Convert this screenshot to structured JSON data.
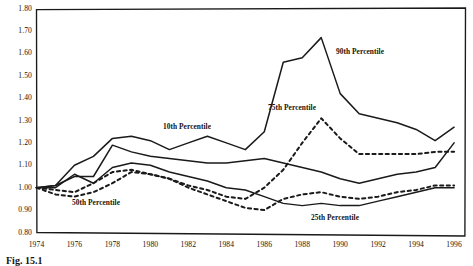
{
  "figure": {
    "caption": "Fig. 15.1",
    "background_color": "#ffffff",
    "line_color": "#1a1a1a"
  },
  "chart_data": {
    "type": "line",
    "title": "",
    "xlabel": "",
    "ylabel": "",
    "xlim": [
      1974,
      1996.6
    ],
    "ylim": [
      0.8,
      1.8
    ],
    "ytick_step": 0.1,
    "grid": false,
    "legend": "inline-annotations",
    "yticks": [
      "1.80",
      "1.70",
      "1.60",
      "1.50",
      "1.40",
      "1.30",
      "1.20",
      "1.10",
      "1.00",
      "0.90",
      "0.80"
    ],
    "xticks": [
      "1974",
      "1976",
      "1978",
      "1980",
      "1982",
      "1984",
      "1986",
      "1988",
      "1990",
      "1992",
      "1994",
      "1996"
    ],
    "x": [
      1974,
      1975,
      1976,
      1977,
      1978,
      1979,
      1980,
      1981,
      1982,
      1983,
      1984,
      1985,
      1986,
      1987,
      1988,
      1989,
      1990,
      1991,
      1992,
      1993,
      1994,
      1995,
      1996
    ],
    "series": [
      {
        "name": "90th Percentile",
        "style": "solid",
        "label": "90th Percentile",
        "values": [
          1.0,
          1.01,
          1.1,
          1.14,
          1.22,
          1.23,
          1.21,
          1.17,
          1.2,
          1.23,
          1.2,
          1.17,
          1.25,
          1.56,
          1.58,
          1.67,
          1.42,
          1.33,
          1.31,
          1.29,
          1.26,
          1.21,
          1.27
        ]
      },
      {
        "name": "75th Percentile",
        "style": "dashed",
        "label": "75th Percentile",
        "values": [
          1.0,
          0.99,
          0.98,
          1.02,
          1.07,
          1.08,
          1.06,
          1.04,
          1.01,
          0.99,
          0.96,
          0.95,
          1.0,
          1.08,
          1.2,
          1.31,
          1.22,
          1.15,
          1.15,
          1.15,
          1.15,
          1.16,
          1.16
        ]
      },
      {
        "name": "10th Percentile",
        "style": "solid",
        "label": "10th Percentile",
        "values": [
          1.0,
          1.01,
          1.05,
          1.05,
          1.19,
          1.16,
          1.14,
          1.13,
          1.12,
          1.11,
          1.11,
          1.12,
          1.13,
          1.11,
          1.09,
          1.07,
          1.04,
          1.02,
          1.04,
          1.06,
          1.07,
          1.09,
          1.2
        ]
      },
      {
        "name": "50th Percentile",
        "style": "solid",
        "label": "50th Percentile",
        "values": [
          1.0,
          1.0,
          1.06,
          1.02,
          1.09,
          1.11,
          1.1,
          1.07,
          1.05,
          1.03,
          1.0,
          0.99,
          0.96,
          0.93,
          0.92,
          0.93,
          0.92,
          0.92,
          0.94,
          0.96,
          0.98,
          1.0,
          1.0
        ]
      },
      {
        "name": "25th Percentile",
        "style": "dashed",
        "label": "25th Percentile",
        "values": [
          1.0,
          0.97,
          0.96,
          0.98,
          1.02,
          1.07,
          1.06,
          1.04,
          1.0,
          0.97,
          0.94,
          0.91,
          0.9,
          0.95,
          0.97,
          0.98,
          0.96,
          0.95,
          0.96,
          0.98,
          0.99,
          1.01,
          1.01
        ]
      }
    ],
    "annotations": [
      {
        "text": "90th Percentile",
        "x_px": 336,
        "y_px": 47
      },
      {
        "text": "75th Percentile",
        "x_px": 268,
        "y_px": 103
      },
      {
        "text": "10th Percentile",
        "x_px": 163,
        "y_px": 122
      },
      {
        "text": "50th Percentile",
        "x_px": 72,
        "y_px": 198
      },
      {
        "text": "25th Percentile",
        "x_px": 311,
        "y_px": 213
      }
    ]
  }
}
